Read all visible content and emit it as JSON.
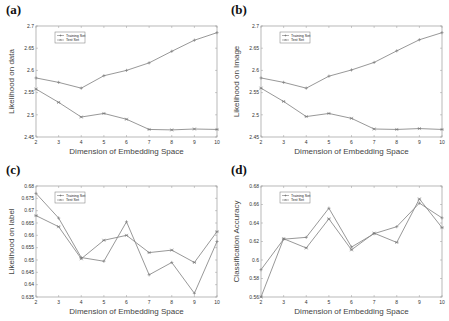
{
  "figure": {
    "panels": [
      {
        "id": "a",
        "label": "(a)"
      },
      {
        "id": "b",
        "label": "(b)"
      },
      {
        "id": "c",
        "label": "(c)"
      },
      {
        "id": "d",
        "label": "(d)"
      }
    ]
  },
  "chart_data": [
    {
      "panel": "(a)",
      "type": "line",
      "title": "",
      "xlabel": "Dimension of Embedding Space",
      "ylabel": "Likelihood on data",
      "x": [
        2,
        3,
        4,
        5,
        6,
        7,
        8,
        9,
        10
      ],
      "xlim": [
        2,
        10
      ],
      "ylim": [
        2.45,
        2.7
      ],
      "yticks": [
        2.45,
        2.5,
        2.55,
        2.6,
        2.65,
        2.7
      ],
      "ytick_labels": [
        "2.45",
        "2.5",
        "2.55",
        "2.6",
        "2.65",
        "2.7"
      ],
      "legend": [
        "Training Set",
        "Test Set"
      ],
      "legend_position": "upper left",
      "grid": false,
      "series": [
        {
          "name": "Training Set",
          "marker": "+",
          "values": [
            2.583,
            2.573,
            2.56,
            2.588,
            2.6,
            2.617,
            2.643,
            2.668,
            2.685
          ]
        },
        {
          "name": "Test Set",
          "marker": "*",
          "values": [
            2.558,
            2.528,
            2.495,
            2.503,
            2.49,
            2.467,
            2.466,
            2.468,
            2.467
          ]
        }
      ]
    },
    {
      "panel": "(b)",
      "type": "line",
      "title": "",
      "xlabel": "Dimension of Embedding Space",
      "ylabel": "Likelihood on Image",
      "x": [
        2,
        3,
        4,
        5,
        6,
        7,
        8,
        9,
        10
      ],
      "xlim": [
        2,
        10
      ],
      "ylim": [
        2.45,
        2.7
      ],
      "yticks": [
        2.45,
        2.5,
        2.55,
        2.6,
        2.65,
        2.7
      ],
      "ytick_labels": [
        "2.45",
        "2.5",
        "2.55",
        "2.6",
        "2.65",
        "2.7"
      ],
      "legend": [
        "Training Set",
        "Test Set"
      ],
      "legend_position": "upper left",
      "grid": false,
      "series": [
        {
          "name": "Training Set",
          "marker": "+",
          "values": [
            2.583,
            2.573,
            2.56,
            2.587,
            2.601,
            2.618,
            2.644,
            2.669,
            2.685
          ]
        },
        {
          "name": "Test Set",
          "marker": "*",
          "values": [
            2.56,
            2.53,
            2.496,
            2.503,
            2.492,
            2.468,
            2.467,
            2.469,
            2.467
          ]
        }
      ]
    },
    {
      "panel": "(c)",
      "type": "line",
      "title": "",
      "xlabel": "Dimension of Embedding Space",
      "ylabel": "Likelihood on label",
      "x": [
        2,
        3,
        4,
        5,
        6,
        7,
        8,
        9,
        10
      ],
      "xlim": [
        2,
        10
      ],
      "ylim": [
        0.635,
        0.68
      ],
      "yticks": [
        0.635,
        0.64,
        0.645,
        0.65,
        0.655,
        0.66,
        0.665,
        0.67,
        0.675,
        0.68
      ],
      "ytick_labels": [
        "0.635",
        "0.64",
        "0.645",
        "0.65",
        "0.655",
        "0.66",
        "0.665",
        "0.67",
        "0.675",
        "0.68"
      ],
      "legend": [
        "Training Set",
        "Test Set"
      ],
      "legend_position": "upper left",
      "grid": false,
      "series": [
        {
          "name": "Training Set",
          "marker": "+",
          "values": [
            0.677,
            0.667,
            0.651,
            0.6495,
            0.6655,
            0.644,
            0.649,
            0.6365,
            0.6575
          ]
        },
        {
          "name": "Test Set",
          "marker": "*",
          "values": [
            0.668,
            0.6635,
            0.6505,
            0.658,
            0.66,
            0.653,
            0.654,
            0.649,
            0.6615
          ]
        }
      ]
    },
    {
      "panel": "(d)",
      "type": "line",
      "title": "",
      "xlabel": "Dimension of Embedding Space",
      "ylabel": "Classification Accuracy",
      "x": [
        2,
        3,
        4,
        5,
        6,
        7,
        8,
        9,
        10
      ],
      "xlim": [
        2,
        10
      ],
      "ylim": [
        0.56,
        0.68
      ],
      "yticks": [
        0.56,
        0.58,
        0.6,
        0.62,
        0.64,
        0.66,
        0.68
      ],
      "ytick_labels": [
        "0.56",
        "0.58",
        "0.6",
        "0.62",
        "0.64",
        "0.66",
        "0.68"
      ],
      "legend": [
        "Training Set",
        "Test Set"
      ],
      "legend_position": "upper left",
      "grid": false,
      "series": [
        {
          "name": "Training Set",
          "marker": "+",
          "values": [
            0.5895,
            0.6225,
            0.6245,
            0.656,
            0.614,
            0.6285,
            0.636,
            0.6615,
            0.6455
          ]
        },
        {
          "name": "Test Set",
          "marker": "*",
          "values": [
            0.56,
            0.623,
            0.613,
            0.6445,
            0.611,
            0.629,
            0.619,
            0.666,
            0.635
          ]
        }
      ]
    }
  ],
  "style": {
    "line_color": "#8c8c8c",
    "axis_color": "#9a9a9a",
    "text_color": "#333333",
    "background": "#ffffff"
  }
}
